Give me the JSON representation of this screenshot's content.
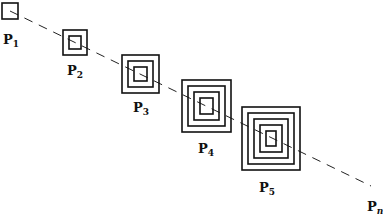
{
  "diagram": {
    "points": [
      {
        "label": "P",
        "sub": "1",
        "rings": 1
      },
      {
        "label": "P",
        "sub": "2",
        "rings": 2
      },
      {
        "label": "P",
        "sub": "3",
        "rings": 3
      },
      {
        "label": "P",
        "sub": "4",
        "rings": 4
      },
      {
        "label": "P",
        "sub": "5",
        "rings": 5
      }
    ],
    "end_label": {
      "label": "P",
      "sub": "n"
    },
    "line_style": "dashed",
    "stroke_color": "#111111"
  }
}
